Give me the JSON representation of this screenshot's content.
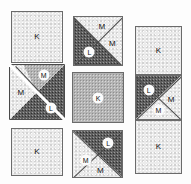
{
  "figure": {
    "grid": {
      "rows": 3,
      "columns": 3
    },
    "legend_letters": [
      "K",
      "L",
      "M"
    ],
    "colors": {
      "light_texture": "#ebebeb",
      "mid_texture": "#b4b4b4",
      "dark_texture": "#5f5f5f",
      "outline": "#6b6b6b",
      "label_text": "#121212",
      "background": "#fdfdfd"
    }
  },
  "tiles": [
    {
      "id": "tile-r1c1",
      "name": "top-left-square",
      "shape": "square",
      "fill": "light",
      "pieces": [
        {
          "letter": "K",
          "tone": "light",
          "badge": false
        }
      ]
    },
    {
      "id": "tile-r1c2",
      "name": "top-middle-x-split-square",
      "shape": "square-x-split",
      "pieces": [
        {
          "letter": "M",
          "tone": "light",
          "position": "top",
          "badge": false
        },
        {
          "letter": "M",
          "tone": "light",
          "position": "right",
          "badge": false
        },
        {
          "letter": "L",
          "tone": "dark",
          "position": "left",
          "badge": true
        },
        {
          "letter": "",
          "tone": "dark",
          "position": "bottom",
          "badge": false
        }
      ]
    },
    {
      "id": "tile-r1c3",
      "name": "right-column-top-rectangle",
      "shape": "rectangle",
      "fill": "light",
      "pieces": [
        {
          "letter": "K",
          "tone": "light",
          "badge": false
        }
      ]
    },
    {
      "id": "tile-r2c1",
      "name": "middle-left-split-square",
      "shape": "square-diagonal-gap",
      "pieces": [
        {
          "letter": "M",
          "tone": "mid",
          "position": "upper-inner",
          "badge": true
        },
        {
          "letter": "M",
          "tone": "light",
          "position": "upper-left",
          "badge": false
        },
        {
          "letter": "L",
          "tone": "dark",
          "position": "lower-right",
          "badge": true
        }
      ]
    },
    {
      "id": "tile-r2c2",
      "name": "center-square",
      "shape": "square",
      "fill": "mid",
      "pieces": [
        {
          "letter": "K",
          "tone": "mid",
          "badge": true
        }
      ]
    },
    {
      "id": "tile-r2c3",
      "name": "right-column-middle-x-split",
      "shape": "rectangle-x-split",
      "pieces": [
        {
          "letter": "L",
          "tone": "dark",
          "position": "left",
          "badge": true
        },
        {
          "letter": "M",
          "tone": "light",
          "position": "right",
          "badge": false
        },
        {
          "letter": "M",
          "tone": "light",
          "position": "bottom",
          "badge": false
        },
        {
          "letter": "",
          "tone": "dark",
          "position": "top",
          "badge": false
        }
      ]
    },
    {
      "id": "tile-r3c1",
      "name": "bottom-left-square",
      "shape": "square",
      "fill": "light",
      "pieces": [
        {
          "letter": "K",
          "tone": "light",
          "badge": false
        }
      ]
    },
    {
      "id": "tile-r3c2",
      "name": "bottom-middle-x-split-square",
      "shape": "square-x-split",
      "pieces": [
        {
          "letter": "L",
          "tone": "dark",
          "position": "right",
          "badge": true
        },
        {
          "letter": "M",
          "tone": "light",
          "position": "left",
          "badge": true
        },
        {
          "letter": "M",
          "tone": "light",
          "position": "bottom",
          "badge": false
        },
        {
          "letter": "",
          "tone": "dark",
          "position": "top",
          "badge": false
        }
      ]
    },
    {
      "id": "tile-r3c3",
      "name": "right-column-bottom-rectangle",
      "shape": "rectangle",
      "fill": "light",
      "pieces": [
        {
          "letter": "K",
          "tone": "light",
          "badge": false
        }
      ]
    }
  ]
}
